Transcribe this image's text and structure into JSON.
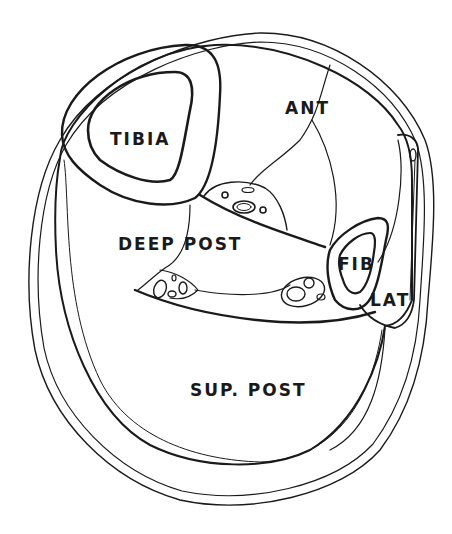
{
  "diagram": {
    "type": "anatomical cross-section",
    "labels": {
      "tibia": "TIBIA",
      "ant": "ANT",
      "deep_post": "DEEP POST",
      "fib": "FIB",
      "lat": "LAT",
      "sup_post": "SUP. POST"
    },
    "colors": {
      "line": "#1a1a1a",
      "background": "#ffffff"
    }
  }
}
